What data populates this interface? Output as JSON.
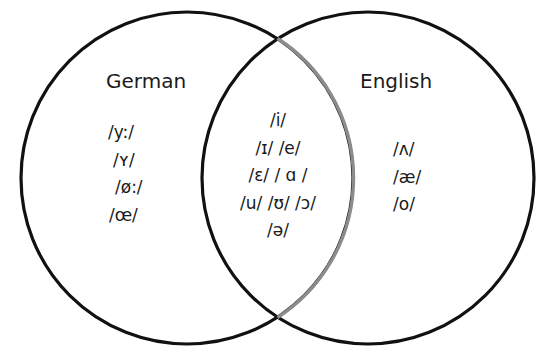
{
  "diagram": {
    "type": "venn",
    "colors": {
      "circle_stroke": "#111111",
      "overlap_arc_stroke": "#8c8c8c",
      "background": "#ffffff",
      "text": "#1a1a1a"
    },
    "sets": [
      {
        "id": "german",
        "label": "German",
        "exclusive_items": [
          "/y:/",
          "/ʏ/",
          "/ø:/",
          "/œ/"
        ]
      },
      {
        "id": "english",
        "label": "English",
        "exclusive_items": [
          "/ʌ/",
          "/æ/",
          "/o/"
        ]
      }
    ],
    "intersection": {
      "lines": [
        "/i/",
        "/ɪ/ /e/",
        "/ɛ/ / ɑ /",
        "/u/ /ʊ/ /ɔ/",
        "/ə/"
      ]
    }
  }
}
